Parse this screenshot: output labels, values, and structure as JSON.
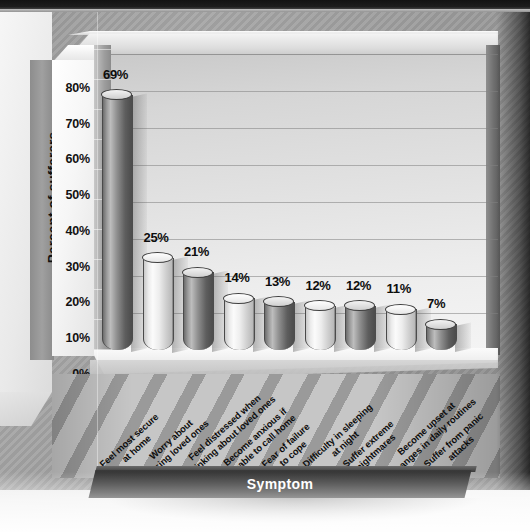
{
  "chart_data": {
    "type": "bar",
    "title": "",
    "xlabel": "Symptom",
    "ylabel": "Percent of sufferers",
    "ylim": [
      0,
      80
    ],
    "grid": true,
    "legend": "none",
    "ytick_labels": [
      "80%",
      "70%",
      "60%",
      "50%",
      "40%",
      "30%",
      "20%",
      "10%",
      "0%"
    ],
    "ytick_values": [
      80,
      70,
      60,
      50,
      40,
      30,
      20,
      10,
      0
    ],
    "categories": [
      "Feel most secure\nat home",
      "Worry about\nlosing loved ones",
      "Feel distressed when\nthinking about loved ones",
      "Become anxious if\nunable to call home",
      "Fear of failure\nto cope",
      "Difficulty in sleeping\nat night",
      "Suffer extreme\nnightmares",
      "Become upset at\nchanges in daily routines",
      "Suffer from panic\nattacks"
    ],
    "values": [
      69,
      25,
      21,
      14,
      13,
      12,
      12,
      11,
      7
    ],
    "data_labels": [
      "69%",
      "25%",
      "21%",
      "14%",
      "13%",
      "12%",
      "12%",
      "11%",
      "7%"
    ],
    "bar_styles": [
      "dark",
      "light",
      "dark",
      "light",
      "dark",
      "light",
      "dark",
      "light",
      "dark"
    ]
  },
  "colors": {
    "bar_dark": "#6d6d6d",
    "bar_light": "#ededed",
    "plot_background": "#e2e2e2",
    "axis_title_bar": "#2a2a2a",
    "axis_title_text": "#ffffff",
    "label_text": "#0d0d0d",
    "outer_background": "#9b9b9b"
  }
}
